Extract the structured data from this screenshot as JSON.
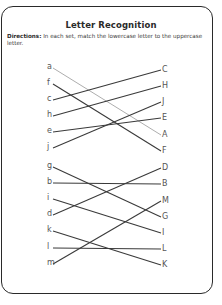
{
  "worksheet": {
    "title": "Letter Recognition",
    "directions_label": "Directions:",
    "directions_text": " In each set, match the lowercase letter to the uppercase letter."
  },
  "sets": [
    {
      "lowercase": [
        {
          "letter": "a",
          "y": 68
        },
        {
          "letter": "f",
          "y": 84
        },
        {
          "letter": "c",
          "y": 100
        },
        {
          "letter": "h",
          "y": 116
        },
        {
          "letter": "e",
          "y": 132
        },
        {
          "letter": "j",
          "y": 148
        }
      ],
      "uppercase": [
        {
          "letter": "C",
          "y": 70
        },
        {
          "letter": "H",
          "y": 86
        },
        {
          "letter": "J",
          "y": 102
        },
        {
          "letter": "E",
          "y": 118
        },
        {
          "letter": "A",
          "y": 135
        },
        {
          "letter": "F",
          "y": 151
        }
      ],
      "matches": [
        [
          "a",
          "A"
        ],
        [
          "f",
          "F"
        ],
        [
          "c",
          "C"
        ],
        [
          "h",
          "H"
        ],
        [
          "e",
          "E"
        ],
        [
          "j",
          "J"
        ]
      ]
    },
    {
      "lowercase": [
        {
          "letter": "g",
          "y": 167
        },
        {
          "letter": "b",
          "y": 183
        },
        {
          "letter": "i",
          "y": 199
        },
        {
          "letter": "d",
          "y": 215
        },
        {
          "letter": "k",
          "y": 231
        },
        {
          "letter": "l",
          "y": 248
        },
        {
          "letter": "m",
          "y": 264
        }
      ],
      "uppercase": [
        {
          "letter": "D",
          "y": 168
        },
        {
          "letter": "B",
          "y": 184
        },
        {
          "letter": "M",
          "y": 201
        },
        {
          "letter": "G",
          "y": 217
        },
        {
          "letter": "I",
          "y": 233
        },
        {
          "letter": "L",
          "y": 249
        },
        {
          "letter": "K",
          "y": 265
        }
      ],
      "matches": [
        [
          "g",
          "G"
        ],
        [
          "b",
          "B"
        ],
        [
          "i",
          "I"
        ],
        [
          "d",
          "D"
        ],
        [
          "k",
          "K"
        ],
        [
          "l",
          "L"
        ],
        [
          "m",
          "M"
        ]
      ]
    }
  ],
  "colors": {
    "line": "#3a3a3a",
    "line_light": "#8a8a8a",
    "frame": "#2a2a2a"
  }
}
